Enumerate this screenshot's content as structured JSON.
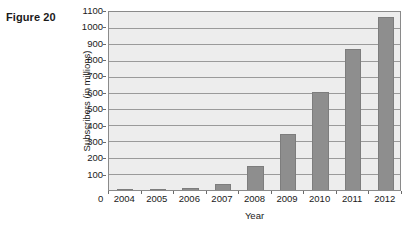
{
  "figure": {
    "label": "Figure 20"
  },
  "chart_data": {
    "type": "bar",
    "title": "",
    "xlabel": "Year",
    "ylabel": "Subscribers (in millions)",
    "categories": [
      "2004",
      "2005",
      "2006",
      "2007",
      "2008",
      "2009",
      "2010",
      "2011",
      "2012"
    ],
    "values": [
      1,
      3,
      10,
      35,
      145,
      345,
      600,
      860,
      1060
    ],
    "ylim": [
      0,
      1100
    ],
    "ytick_step": 100,
    "yticks": [
      0,
      100,
      200,
      300,
      400,
      500,
      600,
      700,
      800,
      900,
      1000,
      1100
    ],
    "ytick_labels": [
      "100",
      "200",
      "300",
      "400",
      "500",
      "600",
      "700",
      "800",
      "900",
      "1000",
      "1100"
    ],
    "x_origin_label": "0",
    "grid": true,
    "legend": false,
    "series": [
      {
        "name": "Subscribers",
        "values": [
          1,
          3,
          10,
          35,
          145,
          345,
          600,
          860,
          1060
        ]
      }
    ],
    "colors": {
      "bar": "#8e8e8e",
      "plot_background": "#ededed",
      "gridline": "#9a9a9a",
      "axis": "#8a8a8a",
      "text": "#1a1a1a"
    }
  }
}
